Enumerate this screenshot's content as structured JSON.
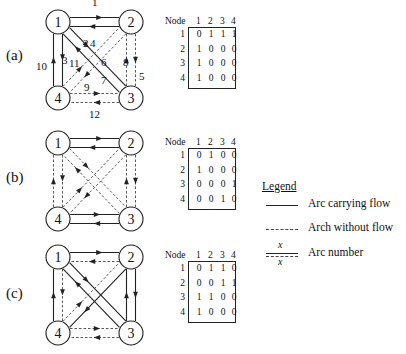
{
  "panels": [
    {
      "label": "(a)",
      "matrix": {
        "header": [
          "Node",
          "1",
          "2",
          "3",
          "4"
        ],
        "rows": [
          {
            "node": "1",
            "values": [
              "0",
              "1",
              "1",
              "1"
            ]
          },
          {
            "node": "2",
            "values": [
              "1",
              "0",
              "0",
              "0"
            ]
          },
          {
            "node": "3",
            "values": [
              "1",
              "0",
              "0",
              "0"
            ]
          },
          {
            "node": "4",
            "values": [
              "1",
              "0",
              "0",
              "0"
            ]
          }
        ]
      },
      "arc_numbers": [
        "1",
        "2",
        "3",
        "4",
        "5",
        "6",
        "7",
        "8",
        "9",
        "10",
        "11",
        "12"
      ]
    },
    {
      "label": "(b)",
      "matrix": {
        "header": [
          "Node",
          "1",
          "2",
          "3",
          "4"
        ],
        "rows": [
          {
            "node": "1",
            "values": [
              "0",
              "1",
              "0",
              "0"
            ]
          },
          {
            "node": "2",
            "values": [
              "1",
              "0",
              "0",
              "0"
            ]
          },
          {
            "node": "3",
            "values": [
              "0",
              "0",
              "0",
              "1"
            ]
          },
          {
            "node": "4",
            "values": [
              "0",
              "0",
              "1",
              "0"
            ]
          }
        ]
      }
    },
    {
      "label": "(c)",
      "matrix": {
        "header": [
          "Node",
          "1",
          "2",
          "3",
          "4"
        ],
        "rows": [
          {
            "node": "1",
            "values": [
              "0",
              "1",
              "1",
              "0"
            ]
          },
          {
            "node": "2",
            "values": [
              "0",
              "0",
              "1",
              "1"
            ]
          },
          {
            "node": "3",
            "values": [
              "1",
              "1",
              "0",
              "0"
            ]
          },
          {
            "node": "4",
            "values": [
              "1",
              "0",
              "0",
              "0"
            ]
          }
        ]
      }
    }
  ],
  "nodes": [
    "1",
    "2",
    "3",
    "4"
  ],
  "legend": {
    "title": "Legend",
    "items": [
      {
        "symbol": "solid-line",
        "label": "Arc carrying flow"
      },
      {
        "symbol": "dashed-line",
        "label": "Arch without flow"
      },
      {
        "symbol": "arc-number",
        "label": "Arc number",
        "marker": "x"
      }
    ]
  },
  "colors": {
    "line": "#222222",
    "background": "#ffffff"
  }
}
